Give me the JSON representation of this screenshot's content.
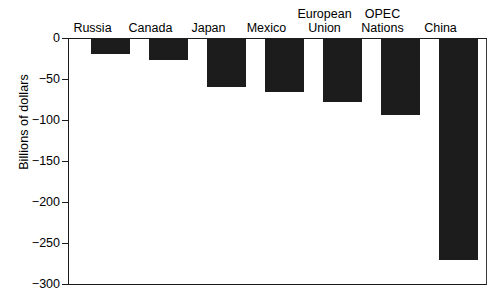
{
  "chart_data": {
    "type": "bar",
    "title": "",
    "subtitle": "",
    "xlabel": "",
    "ylabel": "Billions of dollars",
    "categories": [
      "Russia",
      "Canada",
      "Japan",
      "Mexico",
      "European Union",
      "OPEC Nations",
      "China"
    ],
    "values": [
      -20,
      -27,
      -60,
      -65,
      -78,
      -93,
      -270
    ],
    "ylim": [
      -300,
      0
    ],
    "yticks": [
      0,
      -50,
      -100,
      -150,
      -200,
      -250,
      -300
    ],
    "ytick_labels": [
      "0",
      "−50",
      "−100",
      "−150",
      "−200",
      "−250",
      "−300"
    ],
    "grid": false,
    "legend": null,
    "legend_position": "none",
    "bar_color": "#1c1c1c",
    "axis_color": "#1a1a1a",
    "background_color": "#ffffff",
    "category_label_position": "top",
    "orientation": "vertical"
  },
  "axis": {
    "y_title": "Billions of dollars"
  },
  "labels": {
    "russia": "Russia",
    "canada": "Canada",
    "japan": "Japan",
    "mexico": "Mexico",
    "european_union": "European\nUnion",
    "opec_nations": "OPEC\nNations",
    "china": "China"
  },
  "ticks": {
    "t0": "0",
    "t1": "−50",
    "t2": "−100",
    "t3": "−150",
    "t4": "−200",
    "t5": "−250",
    "t6": "−300"
  }
}
